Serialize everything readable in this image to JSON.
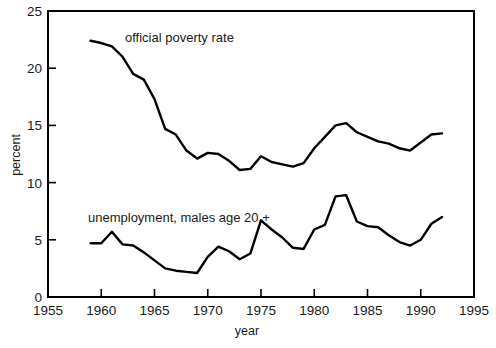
{
  "figure": {
    "background_color": "#ffffff",
    "line_color": "#000000",
    "text_color": "#1a1a1a"
  },
  "axes": {
    "y_title": "percent",
    "x_title": "year",
    "x_ticks": [
      "1955",
      "1960",
      "1965",
      "1970",
      "1975",
      "1980",
      "1985",
      "1990",
      "1995"
    ],
    "y_ticks": [
      "0",
      "5",
      "10",
      "15",
      "20",
      "25"
    ]
  },
  "annotations": {
    "poverty_label": "official poverty rate",
    "unemployment_label": "unemployment, males age 20 +"
  },
  "chart_data": {
    "type": "line",
    "title": "",
    "xlabel": "year",
    "ylabel": "percent",
    "xlim": [
      1955,
      1995
    ],
    "ylim": [
      0,
      25
    ],
    "xticks": [
      1955,
      1960,
      1965,
      1970,
      1975,
      1980,
      1985,
      1990,
      1995
    ],
    "yticks": [
      0,
      5,
      10,
      15,
      20,
      25
    ],
    "grid": false,
    "legend": "inline annotations",
    "x": [
      1959,
      1960,
      1961,
      1962,
      1963,
      1964,
      1965,
      1966,
      1967,
      1968,
      1969,
      1970,
      1971,
      1972,
      1973,
      1974,
      1975,
      1976,
      1977,
      1978,
      1979,
      1980,
      1981,
      1982,
      1983,
      1984,
      1985,
      1986,
      1987,
      1988,
      1989,
      1990,
      1991,
      1992
    ],
    "series": [
      {
        "name": "official poverty rate",
        "values": [
          22.4,
          22.2,
          21.9,
          21.0,
          19.5,
          19.0,
          17.3,
          14.7,
          14.2,
          12.8,
          12.1,
          12.6,
          12.5,
          11.9,
          11.1,
          11.2,
          12.3,
          11.8,
          11.6,
          11.4,
          11.7,
          13.0,
          14.0,
          15.0,
          15.2,
          14.4,
          14.0,
          13.6,
          13.4,
          13.0,
          12.8,
          13.5,
          14.2,
          14.3
        ]
      },
      {
        "name": "unemployment, males age 20 +",
        "values": [
          4.7,
          4.7,
          5.7,
          4.6,
          4.5,
          3.9,
          3.2,
          2.5,
          2.3,
          2.2,
          2.1,
          3.5,
          4.4,
          4.0,
          3.3,
          3.8,
          6.7,
          5.9,
          5.2,
          4.3,
          4.2,
          5.9,
          6.3,
          8.8,
          8.9,
          6.6,
          6.2,
          6.1,
          5.4,
          4.8,
          4.5,
          5.0,
          6.4,
          7.0
        ]
      }
    ]
  }
}
